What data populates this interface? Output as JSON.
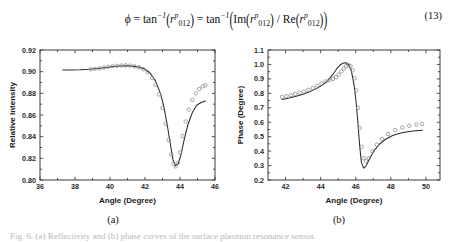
{
  "equation": {
    "number": "(13)",
    "plain": "φ = tan⁻¹(rᵖ₀₁₂) = tan⁻¹(Im(rᵖ₀₁₂) / Re(rᵖ₀₁₂))",
    "phi": "ϕ",
    "equals": "=",
    "tan_inv": "tan",
    "tan_exp": "−1",
    "r_symbol": "r",
    "r_superscript": "p",
    "r_subscript": "012",
    "im_label": "Im",
    "re_label": "Re",
    "divide": "/"
  },
  "panels": [
    {
      "id": "a",
      "caption": "(a)",
      "xlabel": "Angle (Degree)",
      "ylabel": "Relative Intensity",
      "xticks": [
        "36",
        "38",
        "40",
        "42",
        "44",
        "46"
      ],
      "yticks": [
        "0.80",
        "0.82",
        "0.84",
        "0.86",
        "0.88",
        "0.90",
        "0.92"
      ]
    },
    {
      "id": "b",
      "caption": "(b)",
      "xlabel": "Angle (Degree)",
      "ylabel": "Phase (Degree)",
      "xticks": [
        "42",
        "44",
        "46",
        "48",
        "50"
      ],
      "yticks": [
        "0.2",
        "0.3",
        "0.4",
        "0.5",
        "0.6",
        "0.7",
        "0.8",
        "0.9",
        "1.0",
        "1.1"
      ]
    }
  ],
  "figure_caption": "Fig. 6. (a) Reflectivity and (b) phase curves of the surface plasmon resonance sensor.",
  "colors": {
    "line": "#2a2a2a",
    "marker": "#8a8a8a",
    "axis": "#3d3d3d",
    "background": "#ffffff"
  },
  "chart_data": [
    {
      "type": "line",
      "id": "a",
      "title": "",
      "xlabel": "Angle (Degree)",
      "ylabel": "Relative Intensity",
      "xlim": [
        36,
        46
      ],
      "ylim": [
        0.8,
        0.92
      ],
      "xticks": [
        36,
        38,
        40,
        42,
        44,
        46
      ],
      "yticks": [
        0.8,
        0.82,
        0.84,
        0.86,
        0.88,
        0.9,
        0.92
      ],
      "grid": false,
      "legend": "none",
      "series": [
        {
          "name": "theory-line",
          "style": "solid-line",
          "x": [
            37.3,
            37.8,
            38.3,
            38.8,
            39.3,
            39.8,
            40.2,
            40.6,
            41.0,
            41.4,
            41.7,
            42.0,
            42.3,
            42.6,
            42.9,
            43.1,
            43.3,
            43.45,
            43.6,
            43.75,
            43.9,
            44.05,
            44.25,
            44.45,
            44.7,
            44.95,
            45.2,
            45.45
          ],
          "y": [
            0.9015,
            0.9016,
            0.9018,
            0.9022,
            0.9029,
            0.9039,
            0.9048,
            0.9053,
            0.9054,
            0.9049,
            0.904,
            0.9022,
            0.8985,
            0.8915,
            0.879,
            0.866,
            0.848,
            0.833,
            0.8185,
            0.813,
            0.815,
            0.823,
            0.838,
            0.851,
            0.862,
            0.869,
            0.8715,
            0.873
          ]
        },
        {
          "name": "experiment-markers",
          "style": "open-circles",
          "x": [
            38.9,
            39.15,
            39.4,
            39.65,
            39.9,
            40.15,
            40.4,
            40.65,
            40.9,
            41.15,
            41.4,
            41.65,
            41.9,
            42.15,
            42.4,
            42.6,
            42.8,
            43.0,
            43.18,
            43.35,
            43.5,
            43.62,
            43.75,
            43.88,
            44.0,
            44.15,
            44.32,
            44.5,
            44.7,
            44.9,
            45.1,
            45.3,
            45.45
          ],
          "y": [
            0.9022,
            0.9026,
            0.9031,
            0.9038,
            0.9045,
            0.905,
            0.9054,
            0.9057,
            0.9058,
            0.9056,
            0.905,
            0.904,
            0.9024,
            0.8996,
            0.8942,
            0.888,
            0.879,
            0.8665,
            0.852,
            0.837,
            0.8235,
            0.815,
            0.8125,
            0.816,
            0.8255,
            0.8405,
            0.854,
            0.865,
            0.874,
            0.88,
            0.884,
            0.8865,
            0.8875
          ]
        }
      ]
    },
    {
      "type": "line",
      "id": "b",
      "title": "",
      "xlabel": "Angle (Degree)",
      "ylabel": "Phase (Degree)",
      "xlim": [
        41.0,
        50.8
      ],
      "ylim": [
        0.2,
        1.1
      ],
      "xticks": [
        42,
        44,
        46,
        48,
        50
      ],
      "yticks": [
        0.2,
        0.3,
        0.4,
        0.5,
        0.6,
        0.7,
        0.8,
        0.9,
        1.0,
        1.1
      ],
      "grid": false,
      "legend": "none",
      "series": [
        {
          "name": "theory-line",
          "style": "solid-line",
          "x": [
            41.8,
            42.2,
            42.6,
            43.0,
            43.4,
            43.8,
            44.1,
            44.4,
            44.7,
            44.95,
            45.15,
            45.3,
            45.45,
            45.6,
            45.75,
            45.9,
            46.02,
            46.12,
            46.22,
            46.32,
            46.45,
            46.6,
            46.8,
            47.05,
            47.35,
            47.7,
            48.1,
            48.5,
            48.95,
            49.4,
            49.8
          ],
          "y": [
            0.758,
            0.768,
            0.78,
            0.794,
            0.812,
            0.836,
            0.858,
            0.886,
            0.932,
            0.975,
            1.0,
            1.01,
            1.012,
            0.998,
            0.955,
            0.86,
            0.74,
            0.6,
            0.44,
            0.322,
            0.282,
            0.3,
            0.35,
            0.404,
            0.448,
            0.482,
            0.508,
            0.524,
            0.534,
            0.541,
            0.545
          ]
        },
        {
          "name": "experiment-markers",
          "style": "open-circles",
          "x": [
            41.8,
            42.05,
            42.3,
            42.55,
            42.8,
            43.05,
            43.3,
            43.55,
            43.8,
            44.05,
            44.28,
            44.5,
            44.7,
            44.88,
            45.03,
            45.18,
            45.32,
            45.45,
            45.58,
            45.7,
            45.82,
            45.93,
            46.03,
            46.13,
            46.23,
            46.33,
            46.45,
            46.58,
            46.75,
            46.95,
            47.2,
            47.5,
            47.85,
            48.25,
            48.65,
            49.05,
            49.45,
            49.78
          ],
          "y": [
            0.775,
            0.781,
            0.788,
            0.796,
            0.804,
            0.813,
            0.824,
            0.837,
            0.852,
            0.868,
            0.882,
            0.892,
            0.9,
            0.912,
            0.93,
            0.952,
            0.972,
            0.988,
            0.996,
            0.988,
            0.96,
            0.905,
            0.82,
            0.7,
            0.56,
            0.43,
            0.352,
            0.33,
            0.352,
            0.398,
            0.444,
            0.484,
            0.518,
            0.545,
            0.563,
            0.576,
            0.584,
            0.588
          ]
        }
      ]
    }
  ]
}
